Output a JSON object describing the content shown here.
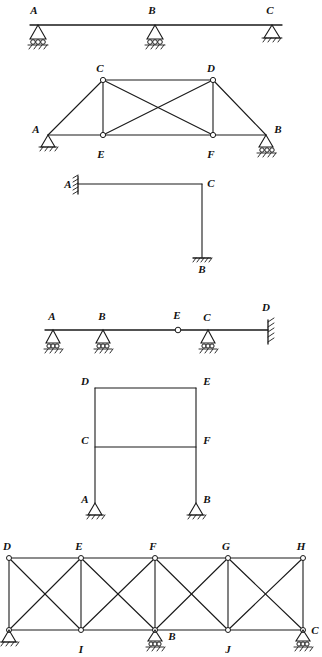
{
  "page": {
    "background_color": "#ffffff",
    "line_color": "#1a1a1a",
    "figure_count": 6
  },
  "figures": [
    {
      "id": "fig-continuous-beam",
      "name": "continuous-beam-ABC",
      "type": "beam",
      "labels": [
        "A",
        "B",
        "C"
      ],
      "nodes": [
        {
          "label": "A",
          "x": 38,
          "y": 25,
          "support": "pin-roller"
        },
        {
          "label": "B",
          "x": 155,
          "y": 25,
          "support": "pin-roller"
        },
        {
          "label": "C",
          "x": 272,
          "y": 25,
          "support": "pin"
        }
      ],
      "members": [
        {
          "from": "A",
          "to": "C"
        }
      ],
      "supports": [
        "pin-roller",
        "pin-roller",
        "pin"
      ]
    },
    {
      "id": "fig-truss-ACDB",
      "name": "pratt-truss-ACDBFE",
      "type": "truss",
      "labels": [
        "A",
        "B",
        "C",
        "D",
        "E",
        "F"
      ],
      "nodes": [
        {
          "label": "C",
          "x": 103,
          "y": 80,
          "support": "none"
        },
        {
          "label": "D",
          "x": 213,
          "y": 80,
          "support": "none"
        },
        {
          "label": "A",
          "x": 48,
          "y": 135,
          "support": "pin"
        },
        {
          "label": "E",
          "x": 103,
          "y": 135,
          "support": "none"
        },
        {
          "label": "F",
          "x": 213,
          "y": 135,
          "support": "none"
        },
        {
          "label": "B",
          "x": 266,
          "y": 135,
          "support": "roller"
        }
      ],
      "members": [
        {
          "from": "A",
          "to": "C"
        },
        {
          "from": "C",
          "to": "D"
        },
        {
          "from": "D",
          "to": "B"
        },
        {
          "from": "A",
          "to": "E"
        },
        {
          "from": "E",
          "to": "F"
        },
        {
          "from": "F",
          "to": "B"
        },
        {
          "from": "C",
          "to": "E"
        },
        {
          "from": "D",
          "to": "F"
        },
        {
          "from": "C",
          "to": "F"
        },
        {
          "from": "D",
          "to": "E"
        }
      ],
      "supports": [
        "pin",
        "roller"
      ]
    },
    {
      "id": "fig-lframe-ACB",
      "name": "l-frame-fixed-wall",
      "type": "frame",
      "labels": [
        "A",
        "C",
        "B"
      ],
      "nodes": [
        {
          "label": "A",
          "x": 78,
          "y": 184,
          "support": "fixed-wall-left"
        },
        {
          "label": "C",
          "x": 202,
          "y": 184,
          "support": "none"
        },
        {
          "label": "B",
          "x": 202,
          "y": 258,
          "support": "fixed-ground"
        }
      ],
      "members": [
        {
          "from": "A",
          "to": "C"
        },
        {
          "from": "C",
          "to": "B"
        }
      ],
      "supports": [
        "fixed-wall-left",
        "fixed-ground"
      ]
    },
    {
      "id": "fig-hinged-beam",
      "name": "beam-with-internal-hinge",
      "type": "beam",
      "labels": [
        "A",
        "B",
        "E",
        "C",
        "D"
      ],
      "nodes": [
        {
          "label": "A",
          "x": 53,
          "y": 330,
          "support": "pin-roller"
        },
        {
          "label": "B",
          "x": 103,
          "y": 330,
          "support": "pin-roller"
        },
        {
          "label": "E",
          "x": 178,
          "y": 330,
          "support": "internal-hinge"
        },
        {
          "label": "C",
          "x": 208,
          "y": 330,
          "support": "pin-roller"
        },
        {
          "label": "D",
          "x": 268,
          "y": 330,
          "support": "fixed-wall-right"
        }
      ],
      "members": [
        {
          "from": "A",
          "to": "D"
        }
      ],
      "supports": [
        "pin-roller",
        "pin-roller",
        "pin-roller",
        "fixed-wall-right"
      ],
      "hinge_at": "E"
    },
    {
      "id": "fig-portal-frame",
      "name": "two-story-portal-frame",
      "type": "frame",
      "labels": [
        "D",
        "E",
        "C",
        "F",
        "A",
        "B"
      ],
      "nodes": [
        {
          "label": "D",
          "x": 95,
          "y": 388,
          "support": "none"
        },
        {
          "label": "E",
          "x": 196,
          "y": 388,
          "support": "none"
        },
        {
          "label": "C",
          "x": 95,
          "y": 447,
          "support": "none"
        },
        {
          "label": "F",
          "x": 196,
          "y": 447,
          "support": "none"
        },
        {
          "label": "A",
          "x": 95,
          "y": 503,
          "support": "pin"
        },
        {
          "label": "B",
          "x": 196,
          "y": 503,
          "support": "pin"
        }
      ],
      "members": [
        {
          "from": "D",
          "to": "E"
        },
        {
          "from": "D",
          "to": "C"
        },
        {
          "from": "E",
          "to": "F"
        },
        {
          "from": "C",
          "to": "F"
        },
        {
          "from": "C",
          "to": "A"
        },
        {
          "from": "F",
          "to": "B"
        }
      ],
      "supports": [
        "pin",
        "pin"
      ]
    },
    {
      "id": "fig-xbraced-truss",
      "name": "cross-braced-truss",
      "type": "truss",
      "labels": [
        "D",
        "E",
        "F",
        "G",
        "H",
        "A",
        "I",
        "B",
        "J",
        "C"
      ],
      "nodes": [
        {
          "label": "D",
          "x": 9,
          "y": 558,
          "support": "none"
        },
        {
          "label": "E",
          "x": 81,
          "y": 558,
          "support": "none"
        },
        {
          "label": "F",
          "x": 155,
          "y": 558,
          "support": "none"
        },
        {
          "label": "G",
          "x": 228,
          "y": 558,
          "support": "none"
        },
        {
          "label": "H",
          "x": 303,
          "y": 558,
          "support": "none"
        },
        {
          "label": "A",
          "x": 9,
          "y": 630,
          "support": "pin"
        },
        {
          "label": "I",
          "x": 81,
          "y": 630,
          "support": "none"
        },
        {
          "label": "B",
          "x": 155,
          "y": 630,
          "support": "roller"
        },
        {
          "label": "J",
          "x": 228,
          "y": 630,
          "support": "none"
        },
        {
          "label": "C",
          "x": 303,
          "y": 630,
          "support": "roller"
        }
      ],
      "members": [
        {
          "from": "D",
          "to": "H"
        },
        {
          "from": "A",
          "to": "C"
        },
        {
          "from": "D",
          "to": "A"
        },
        {
          "from": "E",
          "to": "I"
        },
        {
          "from": "F",
          "to": "B"
        },
        {
          "from": "G",
          "to": "J"
        },
        {
          "from": "H",
          "to": "C"
        },
        {
          "from": "D",
          "to": "I"
        },
        {
          "from": "A",
          "to": "E"
        },
        {
          "from": "E",
          "to": "B"
        },
        {
          "from": "I",
          "to": "F"
        },
        {
          "from": "F",
          "to": "J"
        },
        {
          "from": "B",
          "to": "G"
        },
        {
          "from": "G",
          "to": "C"
        },
        {
          "from": "J",
          "to": "H"
        }
      ],
      "supports": [
        "pin",
        "roller",
        "roller"
      ],
      "panel_count": 4
    }
  ]
}
